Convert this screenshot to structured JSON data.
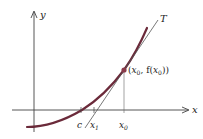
{
  "figure": {
    "axes": {
      "x_label": "x",
      "y_label": "y"
    },
    "tangent_label": "T",
    "point_label": {
      "open": "(",
      "x0": "x",
      "x0_sub": "0",
      "sep": ", f(",
      "fx0": "x",
      "fx0_sub": "0",
      "close": "))"
    },
    "tick_labels": {
      "c": "c",
      "x1": "x",
      "x1_sub": "1",
      "x0": "x",
      "x0_sub": "0"
    },
    "colors": {
      "curve": "#6b2a3a",
      "point": "#8a3a4a",
      "axis": "#444444",
      "tangent": "#555555",
      "text": "#222222"
    }
  }
}
